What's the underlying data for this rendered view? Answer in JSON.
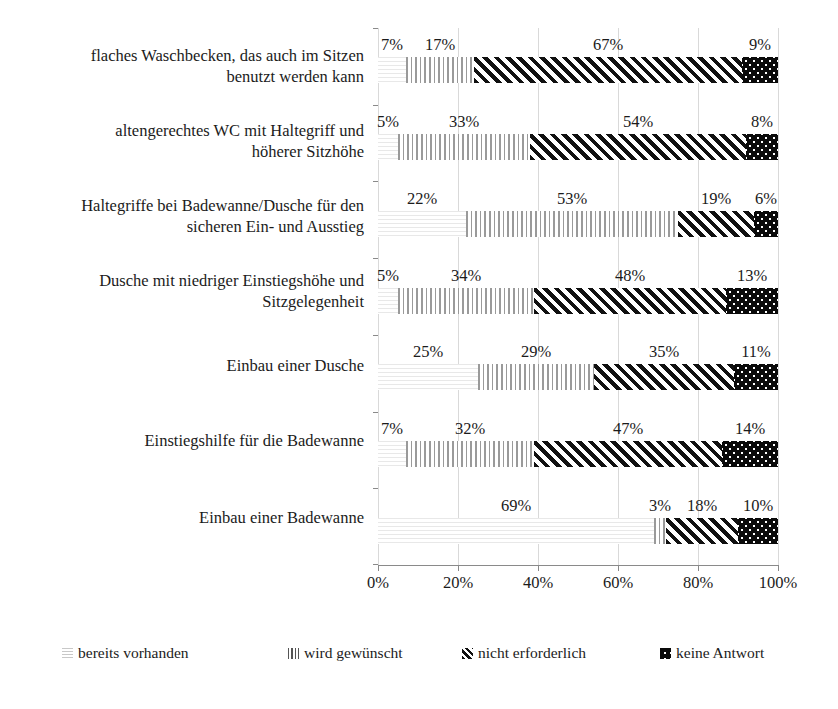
{
  "chart_data": {
    "type": "bar",
    "orientation": "horizontal",
    "stacked": true,
    "stacked_percent": true,
    "title": "",
    "xlabel": "",
    "ylabel": "",
    "xlim": [
      0,
      100
    ],
    "xticks": [
      "0%",
      "20%",
      "40%",
      "60%",
      "80%",
      "100%"
    ],
    "xtick_values": [
      0,
      20,
      40,
      60,
      80,
      100
    ],
    "grid": "vertical",
    "legend_position": "bottom",
    "categories": [
      "flaches Waschbecken, das auch im Sitzen\nbenutzt werden kann",
      "altengerechtes WC mit Haltegriff und\nhöherer Sitzhöhe",
      "Haltegriffe bei Badewanne/Dusche für den\nsicheren Ein- und Ausstieg",
      "Dusche mit niedriger Einstiegshöhe und\nSitzgelegenheit",
      "Einbau einer Dusche",
      "Einstiegshilfe für die Badewanne",
      "Einbau einer Badewanne"
    ],
    "series": [
      {
        "name": "bereits vorhanden",
        "pattern": "light-horizontal-lines",
        "values": [
          7,
          5,
          22,
          5,
          25,
          7,
          69
        ],
        "labels": [
          "7%",
          "5%",
          "22%",
          "5%",
          "25%",
          "7%",
          "69%"
        ]
      },
      {
        "name": "wird gewünscht",
        "pattern": "vertical-lines",
        "values": [
          17,
          33,
          53,
          34,
          29,
          32,
          3
        ],
        "labels": [
          "17%",
          "33%",
          "53%",
          "34%",
          "29%",
          "32%",
          "3%"
        ]
      },
      {
        "name": "nicht erforderlich",
        "pattern": "diagonal-stripes",
        "values": [
          67,
          54,
          19,
          48,
          35,
          47,
          18
        ],
        "labels": [
          "67%",
          "54%",
          "19%",
          "48%",
          "35%",
          "47%",
          "18%"
        ]
      },
      {
        "name": "keine Antwort",
        "pattern": "black-dotted",
        "values": [
          9,
          8,
          6,
          13,
          11,
          14,
          10
        ],
        "labels": [
          "9%",
          "8%",
          "6%",
          "13%",
          "11%",
          "14%",
          "10%"
        ]
      }
    ]
  },
  "legend": {
    "items": [
      {
        "label": "bereits vorhanden",
        "swatch": "light-horizontal-lines-swatch"
      },
      {
        "label": "wird gewünscht",
        "swatch": "vertical-lines-swatch"
      },
      {
        "label": "nicht erforderlich",
        "swatch": "diagonal-stripes-swatch"
      },
      {
        "label": "keine Antwort",
        "swatch": "black-dotted-swatch"
      }
    ]
  },
  "colors": {
    "existing": "#e8e8e8",
    "wanted": "#9a9a9a",
    "not_needed": "#111111",
    "no_answer": "#0a0a0a",
    "grid": "#d9d9d9",
    "axis": "#8a8a8a",
    "text": "#1b1b1b"
  }
}
